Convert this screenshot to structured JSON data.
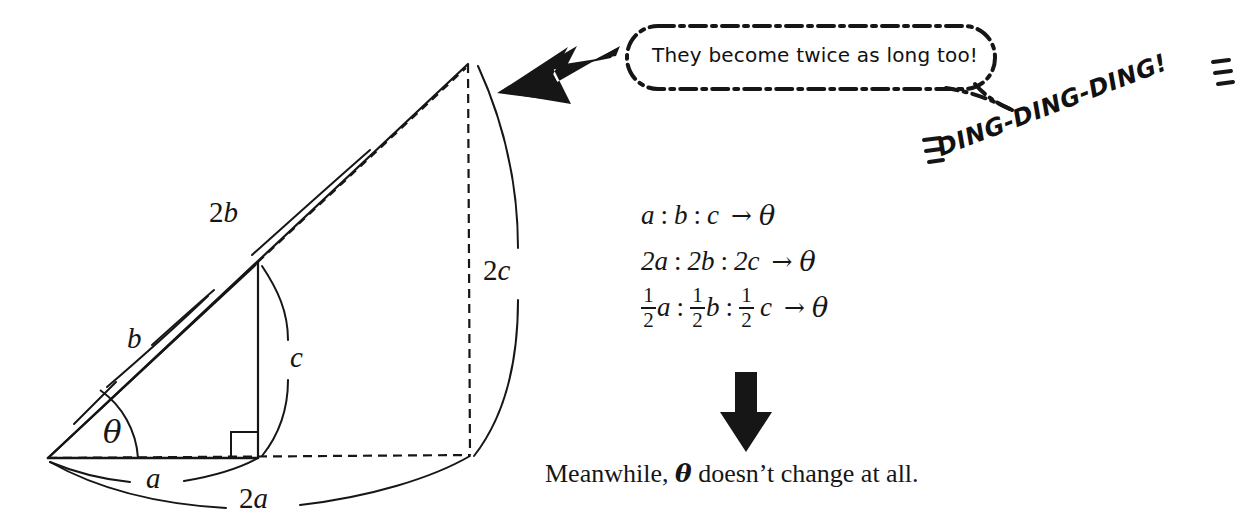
{
  "page": {
    "width": 1247,
    "height": 526,
    "background": "#ffffff",
    "ink_color": "#161616"
  },
  "diagram": {
    "name": "similar-right-triangles-scaling",
    "labels": {
      "side_a": "a",
      "side_b": "b",
      "side_c": "c",
      "side_2a_prefix": "2",
      "side_2a_var": "a",
      "side_2b_prefix": "2",
      "side_2b_var": "b",
      "side_2c_prefix": "2",
      "side_2c_var": "c",
      "angle_theta": "θ"
    }
  },
  "speech_bubble": {
    "text": "They become twice as long too!",
    "style": "dash-dot rounded rectangle"
  },
  "sound_effect": {
    "text": "DING-DING-DING!",
    "rotation_deg": -21
  },
  "equations": [
    {
      "terms": [
        "a",
        "b",
        "c"
      ],
      "separator": ":",
      "arrow": "→",
      "result": "θ",
      "display": "a : b : c → θ"
    },
    {
      "terms": [
        "2a",
        "2b",
        "2c"
      ],
      "separator": ":",
      "arrow": "→",
      "result": "θ",
      "display": "2a : 2b : 2c → θ"
    },
    {
      "terms": [
        "1/2 a",
        "1/2 b",
        "1/2 c"
      ],
      "separator": ":",
      "arrow": "→",
      "result": "θ",
      "fraction": {
        "numerator": "1",
        "denominator": "2"
      },
      "display": "½a : ½b : ½ c → θ"
    }
  ],
  "caption": {
    "before": "Meanwhile, ",
    "theta": "θ",
    "after": " doesn’t change at all."
  },
  "arrows": {
    "pointer_left": "thick black arrow pointing down-left",
    "pointer_down": "thick black arrow pointing down"
  }
}
